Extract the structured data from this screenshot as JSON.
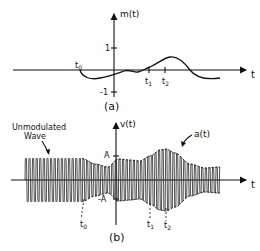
{
  "figure_a": {
    "y_axis_label": "m(t)",
    "x_axis_label": "t",
    "tick_pos": "1",
    "tick_neg": "-1",
    "marker_t0": "t",
    "marker_t0_sub": "0",
    "marker_t1": "t",
    "marker_t1_sub": "1",
    "marker_t2": "t",
    "marker_t2_sub": "2",
    "caption": "(a)"
  },
  "figure_b": {
    "y_axis_label": "v(t)",
    "x_axis_label": "t",
    "tick_pos": "A",
    "tick_neg": "-A",
    "envelope_label": "a(t)",
    "unmodulated_label_line1": "Unmodulated",
    "unmodulated_label_line2": "Wave",
    "marker_t0": "t",
    "marker_t0_sub": "0",
    "marker_t1": "t",
    "marker_t1_sub": "1",
    "marker_t2": "t",
    "marker_t2_sub": "2",
    "caption": "(b)"
  }
}
